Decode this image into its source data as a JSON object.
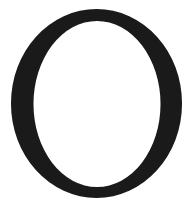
{
  "glyph": {
    "character": "O",
    "style": "serif",
    "fill_color": "#1a1a1a",
    "background_color": "#ffffff"
  }
}
